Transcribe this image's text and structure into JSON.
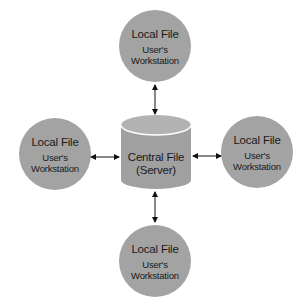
{
  "diagram": {
    "type": "hub-and-spoke",
    "colors": {
      "node_fill": "#a3a3a3",
      "cylinder_fill": "#a0a0a0",
      "cylinder_top": "#b4b4b4",
      "arrow": "#111111",
      "background": "#ffffff"
    },
    "center": {
      "shape": "cylinder",
      "title": "Central File",
      "subtitle": "(Server)"
    },
    "nodes": [
      {
        "position": "top",
        "title": "Local File",
        "subtitle_line1": "User's",
        "subtitle_line2": "Workstation"
      },
      {
        "position": "left",
        "title": "Local File",
        "subtitle_line1": "User's",
        "subtitle_line2": "Workstation"
      },
      {
        "position": "right",
        "title": "Local File",
        "subtitle_line1": "User's",
        "subtitle_line2": "Workstation"
      },
      {
        "position": "bottom",
        "title": "Local File",
        "subtitle_line1": "User's",
        "subtitle_line2": "Workstation"
      }
    ],
    "edges": [
      {
        "from": "top",
        "to": "center",
        "direction": "bidirectional"
      },
      {
        "from": "left",
        "to": "center",
        "direction": "bidirectional"
      },
      {
        "from": "right",
        "to": "center",
        "direction": "bidirectional"
      },
      {
        "from": "bottom",
        "to": "center",
        "direction": "bidirectional"
      }
    ]
  }
}
